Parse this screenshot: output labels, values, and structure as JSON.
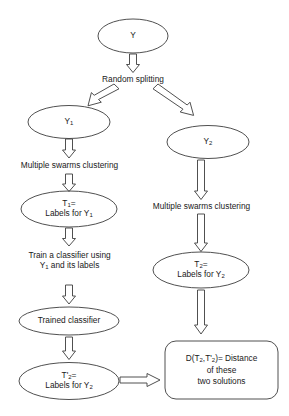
{
  "figure": {
    "type": "flowchart",
    "stroke_color": "#3c3c3c",
    "text_color": "#1a1a1a",
    "background": "#ffffff"
  },
  "nodes": {
    "root": {
      "id": "Y",
      "shape": "ellipse",
      "label": "Y"
    },
    "y1": {
      "id": "Y1",
      "shape": "ellipse",
      "label_main": "Y",
      "label_sub": "1"
    },
    "y2": {
      "id": "Y2",
      "shape": "ellipse",
      "label_main": "Y",
      "label_sub": "2"
    },
    "t1": {
      "id": "T1",
      "shape": "ellipse",
      "line1_main": "T",
      "line1_sub": "1",
      "line1_tail": "=",
      "line2_main": "Labels for Y",
      "line2_sub": "1"
    },
    "t2": {
      "id": "T2",
      "shape": "ellipse",
      "line1_main": "T",
      "line1_sub": "2",
      "line1_tail": "=",
      "line2_main": "Labels for Y",
      "line2_sub": "2"
    },
    "trained_classifier": {
      "id": "TrainedClassifier",
      "shape": "ellipse",
      "label": "Trained classifier"
    },
    "t2prime": {
      "id": "T2prime",
      "shape": "ellipse",
      "line1_main": "T'",
      "line1_sub": "2",
      "line1_tail": "=",
      "line2_main": "Labels for Y",
      "line2_sub": "2"
    },
    "distance": {
      "id": "Distance",
      "shape": "rounded-rect",
      "line1_a": "D(T",
      "line1_sub1": "2",
      "line1_b": ",T'",
      "line1_sub2": "2",
      "line1_c": ")= Distance",
      "line2": "of these",
      "line3": "two solutions"
    }
  },
  "edge_labels": {
    "random_splitting": "Random splitting",
    "multiple_swarms_left": "Multiple swarms clustering",
    "multiple_swarms_right": "Multiple swarms clustering",
    "train_classifier_line1": "Train a classifier using",
    "train_classifier_line2_main": "Y",
    "train_classifier_line2_sub": "1",
    "train_classifier_line2_tail": " and its labels"
  },
  "arrows": [
    {
      "name": "y-to-random-splitting",
      "direction": "down"
    },
    {
      "name": "split-to-y1",
      "direction": "down-left"
    },
    {
      "name": "split-to-y2",
      "direction": "down-right"
    },
    {
      "name": "y1-to-clustering",
      "direction": "down"
    },
    {
      "name": "clustering-to-t1",
      "direction": "down"
    },
    {
      "name": "t1-to-train",
      "direction": "down"
    },
    {
      "name": "train-to-trained-classifier",
      "direction": "down"
    },
    {
      "name": "trained-classifier-to-t2prime",
      "direction": "down"
    },
    {
      "name": "y2-to-clustering",
      "direction": "down"
    },
    {
      "name": "clustering-to-t2",
      "direction": "down"
    },
    {
      "name": "t2-to-distance",
      "direction": "down"
    },
    {
      "name": "t2prime-to-distance",
      "direction": "right"
    }
  ]
}
